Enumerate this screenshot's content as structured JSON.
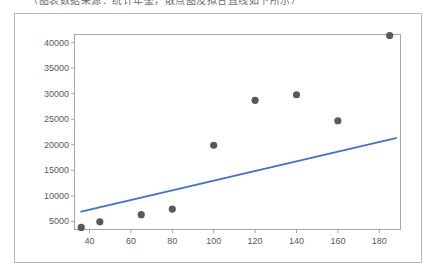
{
  "caption": {
    "text": "（图表数据来源：统计年鉴，散点图及拟合直线如下所示）"
  },
  "colors": {
    "marker": "#595959",
    "trendline": "#4472C4",
    "axis": "#a6a6a6",
    "card_border": "#b9b9b9",
    "tick_text": "#595959",
    "background": "#ffffff"
  },
  "chart_data": {
    "type": "scatter",
    "title": "",
    "xlabel": "",
    "ylabel": "",
    "grid": false,
    "legend": null,
    "xlim": [
      33,
      190
    ],
    "ylim": [
      3500,
      41500
    ],
    "xticks": [
      40,
      60,
      80,
      100,
      120,
      140,
      160,
      180
    ],
    "yticks": [
      5000,
      10000,
      15000,
      20000,
      25000,
      30000,
      35000,
      40000
    ],
    "xtick_labels": [
      "40",
      "60",
      "80",
      "100",
      "120",
      "140",
      "160",
      "180"
    ],
    "ytick_labels": [
      "5000",
      "10000",
      "15000",
      "20000",
      "25000",
      "30000",
      "35000",
      "40000"
    ],
    "series": [
      {
        "name": "observations",
        "type": "scatter",
        "marker": "circle",
        "color": "#595959",
        "points": [
          {
            "x": 36,
            "y": 3800
          },
          {
            "x": 45,
            "y": 4900
          },
          {
            "x": 65,
            "y": 6300
          },
          {
            "x": 80,
            "y": 7400
          },
          {
            "x": 100,
            "y": 19900
          },
          {
            "x": 120,
            "y": 28700
          },
          {
            "x": 140,
            "y": 29800
          },
          {
            "x": 160,
            "y": 24700
          },
          {
            "x": 185,
            "y": 41400
          }
        ]
      },
      {
        "name": "linear-trendline",
        "type": "line",
        "color": "#4472C4",
        "endpoints": [
          {
            "x": 36,
            "y": 6900
          },
          {
            "x": 188,
            "y": 21300
          }
        ]
      }
    ]
  }
}
